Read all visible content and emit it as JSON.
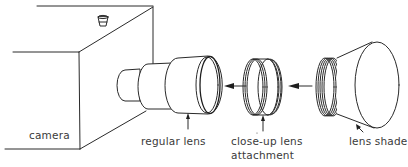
{
  "diagram": {
    "type": "exploded-assembly",
    "components": [
      {
        "id": "camera",
        "label": "camera"
      },
      {
        "id": "regular-lens",
        "label": "regular lens"
      },
      {
        "id": "close-up-lens",
        "label": "close-up lens",
        "label_line2": "attachment"
      },
      {
        "id": "lens-shade",
        "label": "lens shade"
      }
    ],
    "arrows": [
      {
        "from": "close-up-lens",
        "to": "regular-lens",
        "direction": "left"
      },
      {
        "from": "lens-shade",
        "to": "close-up-lens",
        "direction": "left"
      }
    ],
    "colors": {
      "line": "#2a2a2a",
      "text": "#3a3a3a",
      "background": "#ffffff"
    }
  }
}
